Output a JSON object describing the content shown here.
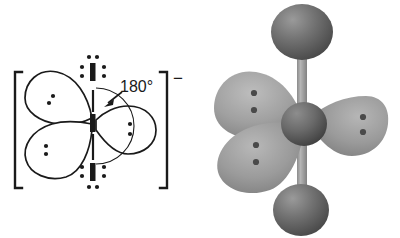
{
  "figure": {
    "panels": [
      {
        "name": "lewis-structure",
        "species_label": "I",
        "charge_label": "−",
        "angle_label": "180°",
        "bracket_left": "[",
        "bracket_right": "]"
      },
      {
        "name": "ball-and-stick-orbital-model",
        "caption": ""
      }
    ]
  },
  "lewis": {
    "central_atom": "I",
    "top_atom": "I",
    "bottom_atom": "I",
    "angle": "180°",
    "charge": "−",
    "lobes": [
      {
        "name": "upper-left-lobe",
        "electrons": 2
      },
      {
        "name": "lower-left-lobe",
        "electrons": 2
      },
      {
        "name": "right-lobe",
        "electrons": 2
      }
    ],
    "terminal_lone_pairs": 3
  },
  "model": {
    "spheres": [
      {
        "name": "top-iodine-sphere"
      },
      {
        "name": "central-iodine-sphere"
      },
      {
        "name": "bottom-iodine-sphere"
      }
    ],
    "orbital_lobes": [
      {
        "name": "upper-left-orbital-lobe",
        "electrons": 2
      },
      {
        "name": "lower-left-orbital-lobe",
        "electrons": 2
      },
      {
        "name": "right-orbital-lobe",
        "electrons": 2
      }
    ],
    "bond_name": "vertical-bond-rod"
  },
  "colors": {
    "ink": "#1a1a1a",
    "background": "#ffffff",
    "sphere_dark": "#6d6d6d",
    "sphere_shadow": "#4a4a4a",
    "sphere_highlight": "#8f8f8f",
    "lobe_gray": "#9b9b9b",
    "lobe_light": "#b4b4b4",
    "lobe_shadow": "#7c7c7c",
    "rod_gray": "#9a9a9a",
    "dot_dark": "#3d3d3d"
  }
}
